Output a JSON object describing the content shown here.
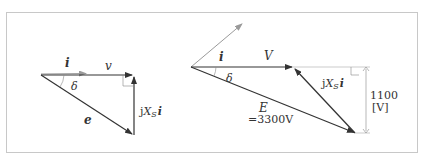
{
  "colors": {
    "frame": "#c8c8c8",
    "vector": "#333333",
    "current": "#9a9a9a",
    "thin": "#888888",
    "text": "#333333"
  },
  "left_diagram": {
    "current_label": "i",
    "voltage_label": "v",
    "emf_label": "e",
    "angle_label": "δ",
    "reactance_label_prefix": "j",
    "reactance_label_X": "X",
    "reactance_label_sub": "S",
    "reactance_label_i": "i"
  },
  "right_diagram": {
    "current_label": "i",
    "voltage_label": "V",
    "emf_label": "E",
    "emf_value": "=3300V",
    "angle_label": "δ",
    "reactance_label_prefix": "j",
    "reactance_label_X": "X",
    "reactance_label_sub": "S",
    "reactance_label_i": "i",
    "dimension_value": "1100",
    "dimension_unit": "[V]"
  }
}
